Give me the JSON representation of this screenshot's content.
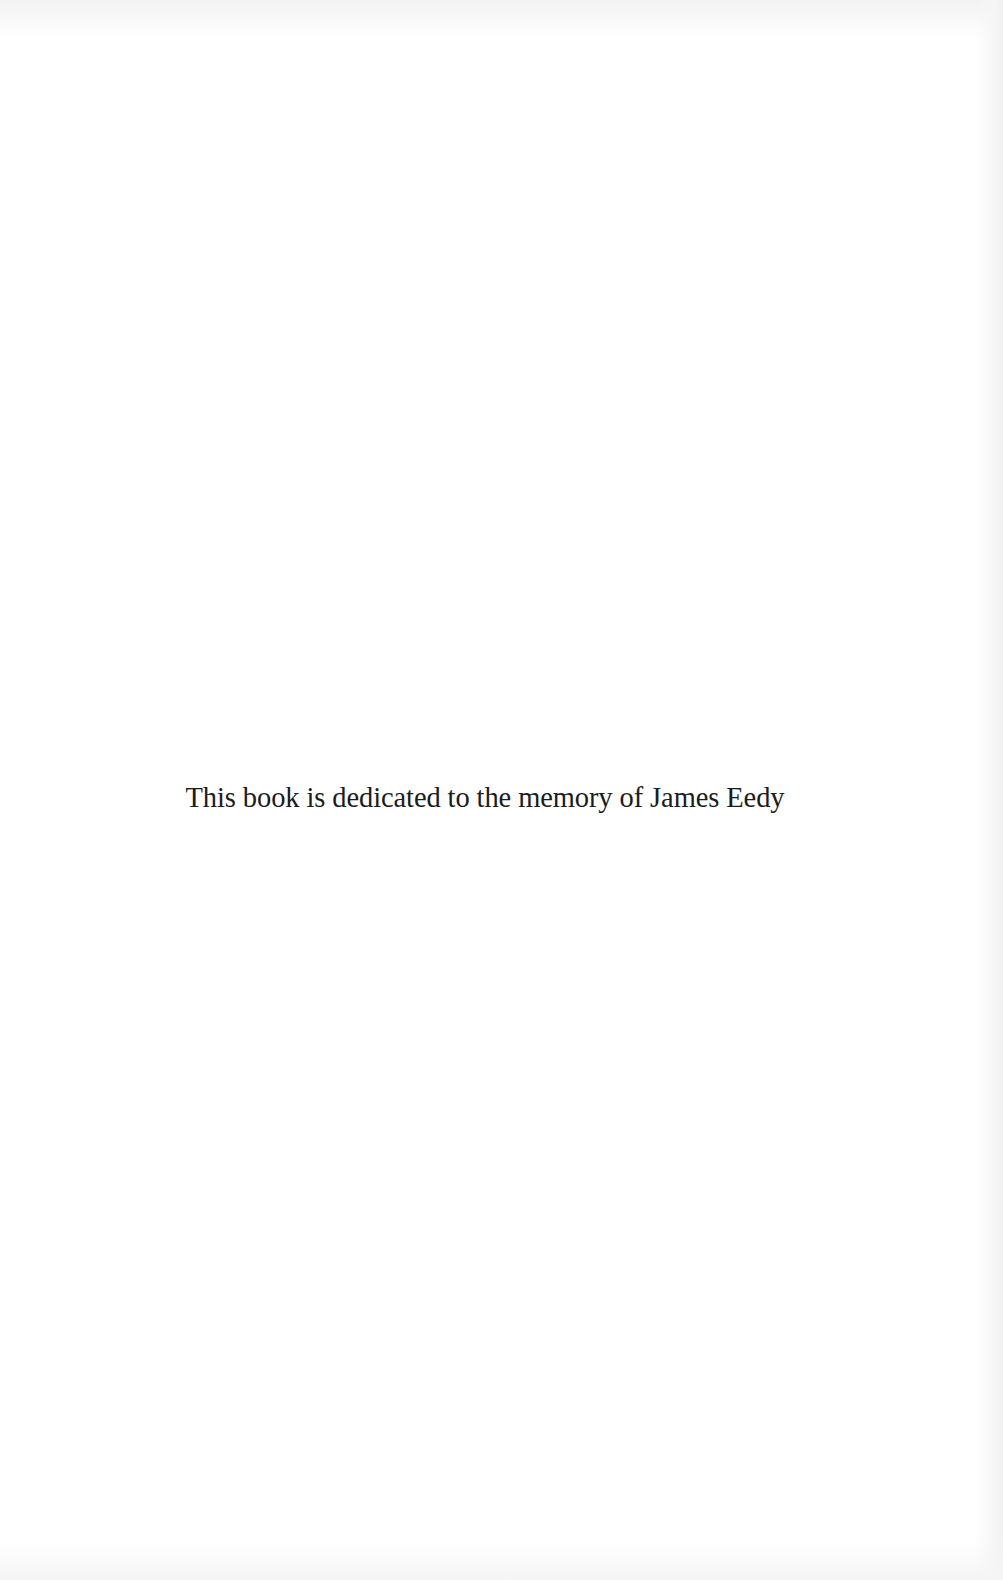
{
  "page": {
    "type": "book-dedication-page",
    "background_color": "#ffffff",
    "text_color": "#1c1c1c"
  },
  "dedication": {
    "text": "This book is dedicated to the memory of James Eedy"
  }
}
